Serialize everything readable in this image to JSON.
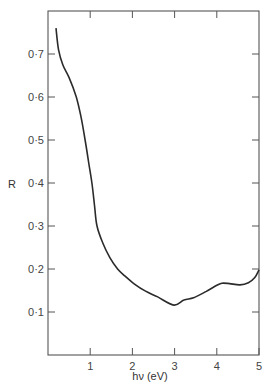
{
  "chart_data": {
    "type": "line",
    "title": "",
    "xlabel": "hν (eV)",
    "ylabel": "R",
    "xlim": [
      0,
      5
    ],
    "ylim": [
      0,
      0.8
    ],
    "grid": false,
    "legend": null,
    "x_ticks": [
      1,
      2,
      3,
      4,
      5
    ],
    "x_tick_labels": [
      "1",
      "2",
      "3",
      "4",
      "5"
    ],
    "y_ticks": [
      0.1,
      0.2,
      0.3,
      0.4,
      0.5,
      0.6,
      0.7
    ],
    "y_tick_labels": [
      "0·1",
      "0·2",
      "0·3",
      "0·4",
      "0·5",
      "0·6",
      "0·7"
    ],
    "series": [
      {
        "name": "R",
        "x": [
          0.19,
          0.25,
          0.35,
          0.5,
          0.67,
          0.78,
          0.88,
          0.96,
          1.04,
          1.1,
          1.16,
          1.3,
          1.47,
          1.65,
          1.82,
          2.05,
          2.3,
          2.6,
          2.98,
          3.22,
          3.45,
          3.75,
          4.0,
          4.12,
          4.3,
          4.55,
          4.75,
          4.9,
          5.0
        ],
        "y": [
          0.76,
          0.71,
          0.675,
          0.645,
          0.6,
          0.555,
          0.5,
          0.45,
          0.4,
          0.35,
          0.3,
          0.26,
          0.226,
          0.2,
          0.184,
          0.165,
          0.149,
          0.135,
          0.116,
          0.128,
          0.133,
          0.148,
          0.162,
          0.167,
          0.166,
          0.163,
          0.168,
          0.18,
          0.198
        ]
      }
    ]
  },
  "labels": {
    "xlabel": "hν (eV)",
    "ylabel": "R"
  }
}
